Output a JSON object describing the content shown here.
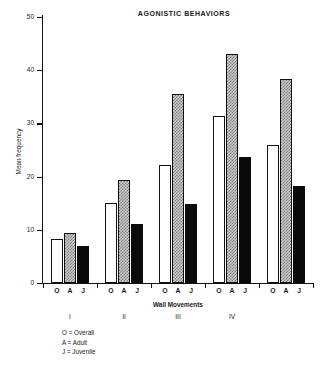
{
  "chart_data": {
    "type": "bar",
    "title": "AGONISTIC BEHAVIORS",
    "xlabel": "Wall Movements",
    "ylabel": "Mean frequency",
    "ylim": [
      0,
      50
    ],
    "yticks": [
      0,
      10,
      20,
      30,
      40,
      50
    ],
    "grid": false,
    "legend_position": "below-left",
    "categories": [
      "I",
      "II",
      "III",
      "IV",
      ""
    ],
    "group_labels": [
      "I",
      "II",
      "III",
      "IV"
    ],
    "tick_labels": [
      "O",
      "A",
      "J",
      "O",
      "A",
      "J",
      "O",
      "A",
      "J",
      "O",
      "A",
      "J",
      "O",
      "A",
      "J"
    ],
    "series": [
      {
        "name": "O",
        "label": "Overall",
        "fill": "white",
        "values": [
          8.2,
          15.0,
          22.2,
          31.3,
          26.0
        ]
      },
      {
        "name": "A",
        "label": "Adult",
        "fill": "checkered",
        "values": [
          9.4,
          19.4,
          35.5,
          43.0,
          38.3
        ]
      },
      {
        "name": "J",
        "label": "Juvenile",
        "fill": "black",
        "values": [
          7.0,
          11.0,
          14.8,
          23.6,
          18.3
        ]
      }
    ],
    "annotations": [
      "O = Overall",
      "A = Adult",
      "J = Juvenile"
    ]
  },
  "legend": {
    "lines": [
      "O = Overall",
      "A = Adult",
      "J = Juvenile"
    ]
  },
  "colors": {
    "axis": "#111111",
    "text": "#1a1a1a",
    "bar_overall": "#ffffff",
    "bar_adult": "#cccccc",
    "bar_juvenile": "#0a0a0a",
    "background": "#ffffff"
  }
}
